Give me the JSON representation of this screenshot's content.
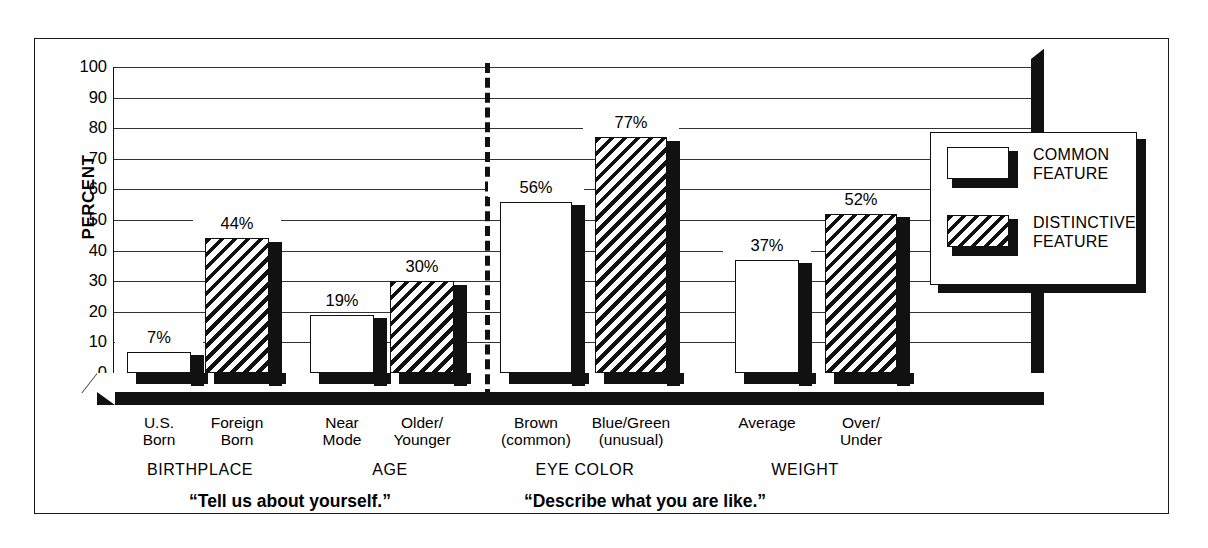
{
  "chart_data": {
    "type": "bar",
    "title": "",
    "xlabel": "",
    "ylabel": "PERCENT",
    "ylim": [
      0,
      100
    ],
    "yticks": [
      "0",
      "10",
      "20",
      "30",
      "40",
      "50",
      "60",
      "70",
      "80",
      "90",
      "100"
    ],
    "grid": true,
    "legend_position": "right-inside",
    "categories": [
      "U.S.\nBorn",
      "Foreign\nBorn",
      "Near\nMode",
      "Older/\nYounger",
      "Brown\n(common)",
      "Blue/Green\n(unusual)",
      "Average",
      "Over/\nUnder"
    ],
    "values": [
      7,
      44,
      19,
      30,
      56,
      77,
      37,
      52
    ],
    "value_labels": [
      "7%",
      "44%",
      "19%",
      "30%",
      "56%",
      "77%",
      "37%",
      "52%"
    ],
    "series": [
      {
        "name": "COMMON\nFEATURE",
        "pattern": "solid-white",
        "values": [
          7,
          null,
          19,
          null,
          56,
          null,
          37,
          null
        ]
      },
      {
        "name": "DISTINCTIVE\nFEATURE",
        "pattern": "diagonal-hatch",
        "values": [
          null,
          44,
          null,
          30,
          null,
          77,
          null,
          52
        ]
      }
    ],
    "series_of_bar": [
      "common",
      "distinctive",
      "common",
      "distinctive",
      "common",
      "distinctive",
      "common",
      "distinctive"
    ],
    "groups": [
      "BIRTHPLACE",
      "AGE",
      "EYE COLOR",
      "WEIGHT"
    ],
    "annotations": [
      "“Tell us about yourself.”",
      "“Describe what you are like.”"
    ],
    "divider": "dashed vertical line between AGE and EYE COLOR"
  },
  "axis": {
    "ylabel": "PERCENT",
    "ticks": [
      "100",
      "90",
      "80",
      "70",
      "60",
      "50",
      "40",
      "30",
      "20",
      "10",
      "0"
    ]
  },
  "bars": [
    {
      "label": "7%",
      "value": 7,
      "cat": "U.S.\nBorn",
      "type": "common"
    },
    {
      "label": "44%",
      "value": 44,
      "cat": "Foreign\nBorn",
      "type": "distinctive"
    },
    {
      "label": "19%",
      "value": 19,
      "cat": "Near\nMode",
      "type": "common"
    },
    {
      "label": "30%",
      "value": 30,
      "cat": "Older/\nYounger",
      "type": "distinctive"
    },
    {
      "label": "56%",
      "value": 56,
      "cat": "Brown\n(common)",
      "type": "common"
    },
    {
      "label": "77%",
      "value": 77,
      "cat": "Blue/Green\n(unusual)",
      "type": "distinctive"
    },
    {
      "label": "37%",
      "value": 37,
      "cat": "Average",
      "type": "common"
    },
    {
      "label": "52%",
      "value": 52,
      "cat": "Over/\nUnder",
      "type": "distinctive"
    }
  ],
  "groups": [
    {
      "name": "BIRTHPLACE"
    },
    {
      "name": "AGE"
    },
    {
      "name": "EYE COLOR"
    },
    {
      "name": "WEIGHT"
    }
  ],
  "quotes": {
    "left": "“Tell us about yourself.”",
    "right": "“Describe what you are like.”"
  },
  "legend": {
    "items": [
      {
        "label": "COMMON\nFEATURE",
        "pattern": "solid-white"
      },
      {
        "label": "DISTINCTIVE\nFEATURE",
        "pattern": "diagonal-hatch"
      }
    ]
  },
  "colors": {
    "ink": "#111111",
    "paper": "#ffffff"
  }
}
